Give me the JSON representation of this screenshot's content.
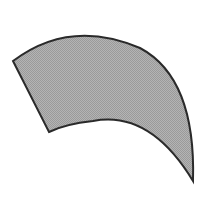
{
  "figure": {
    "fill_color": "#a9a9a9",
    "stroke_color": "#2a2a2a",
    "background_color": "#ffffff"
  }
}
